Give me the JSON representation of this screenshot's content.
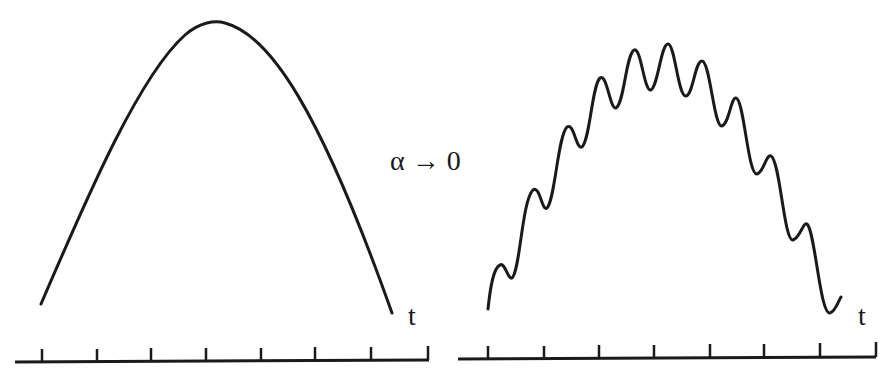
{
  "labels": {
    "transition": "α → 0",
    "t_left": "t",
    "t_right": "t"
  },
  "panels": [
    {
      "name": "smooth-arch",
      "description": "Smooth parabolic arch",
      "axis": {
        "x1": 15,
        "x2": 429,
        "y": 361,
        "ticks": [
          42,
          97,
          151,
          206,
          261,
          315,
          371,
          428
        ],
        "tick_height": 12
      }
    },
    {
      "name": "oscillating-arch",
      "description": "Arch with superimposed oscillations",
      "axis": {
        "x1": 458,
        "x2": 876,
        "y": 358,
        "ticks": [
          488,
          544,
          599,
          654,
          710,
          764,
          820,
          876
        ],
        "tick_height": 12
      }
    }
  ],
  "colors": {
    "ink": "#1a1a1a",
    "background": "#ffffff"
  }
}
